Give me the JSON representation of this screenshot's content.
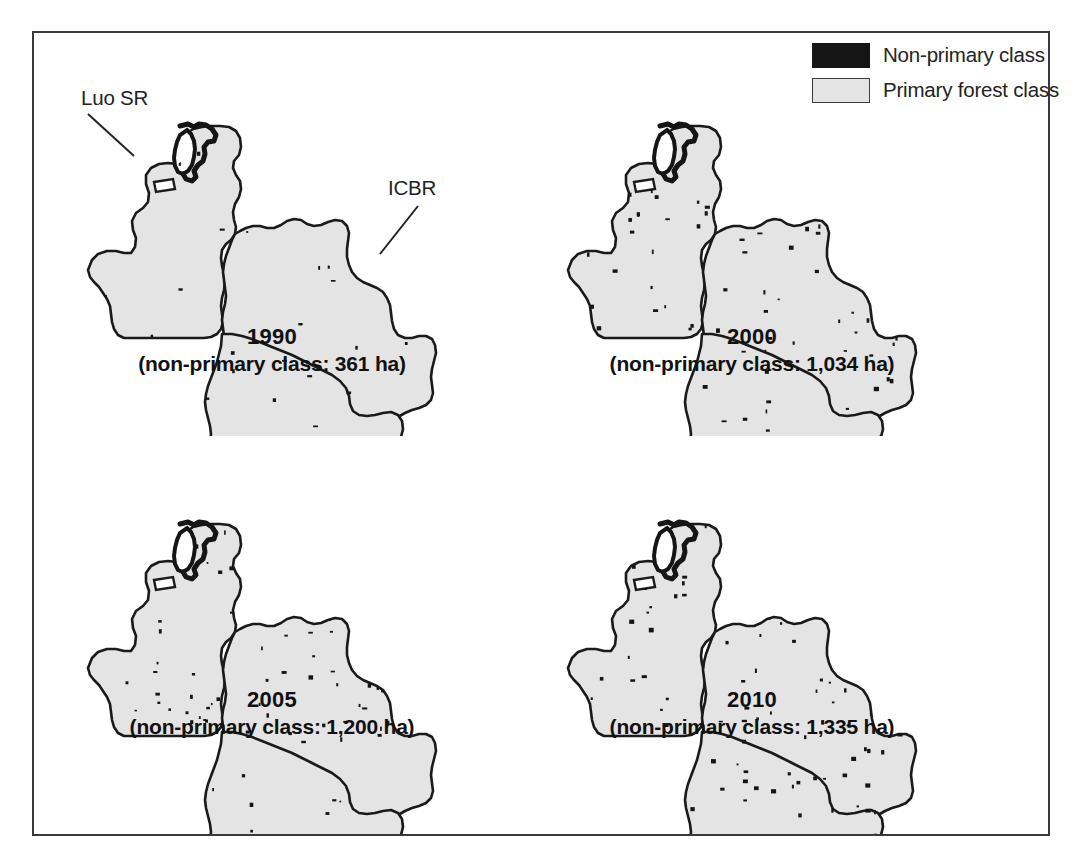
{
  "figure": {
    "background_color": "#ffffff",
    "frame_color": "#3a3a3a",
    "primary_fill_color": "#e4e4e4",
    "nonprimary_color": "#151515",
    "outline_color": "#1a1a1a"
  },
  "legend": {
    "items": [
      {
        "swatch": "nonprimary",
        "label": "Non-primary class",
        "color": "#151515"
      },
      {
        "swatch": "primary",
        "label": "Primary forest class",
        "color": "#e4e4e4"
      }
    ]
  },
  "annotations": [
    {
      "name": "luo-sr",
      "label": "Luo SR"
    },
    {
      "name": "icbr",
      "label": "ICBR"
    }
  ],
  "panels": [
    {
      "id": "1990",
      "year": "1990",
      "caption": "(non-primary class: 361 ha)",
      "nonprimary_ha": 361,
      "speckle_seed": 11,
      "speckle_count": 46
    },
    {
      "id": "2000",
      "year": "2000",
      "caption": "(non-primary class: 1,034 ha)",
      "nonprimary_ha": 1034,
      "speckle_seed": 29,
      "speckle_count": 132
    },
    {
      "id": "2005",
      "year": "2005",
      "caption": "(non-primary class: 1,200 ha)",
      "nonprimary_ha": 1200,
      "speckle_seed": 47,
      "speckle_count": 154
    },
    {
      "id": "2010",
      "year": "2010",
      "caption": "(non-primary class: 1,335 ha)",
      "nonprimary_ha": 1335,
      "speckle_seed": 73,
      "speckle_count": 172
    }
  ],
  "chart_data": {
    "type": "map",
    "title": "",
    "subtitle": "",
    "categories": [
      "1990",
      "2000",
      "2005",
      "2010"
    ],
    "values": [
      361,
      1034,
      1200,
      1335
    ],
    "ylabel": "Non-primary class (ha)",
    "xlabel": "Year",
    "series": [
      {
        "name": "Non-primary class (ha)",
        "values": [
          361,
          1034,
          1200,
          1335
        ]
      }
    ],
    "legend_entries": [
      "Non-primary class",
      "Primary forest class"
    ],
    "legend_position": "top-right",
    "regions": [
      "Luo SR",
      "ICBR"
    ],
    "grid": false
  },
  "geometry": {
    "outline": "M 96 117 L 100 108 L 109 105 L 118 107 L 126 108 L 133 104 L 140 100 L 146 97 L 152 97 L 156 93 L 158 84 L 157 75 L 160 68 L 166 64 L 170 59 L 170 52 L 172 46 L 179 44 L 190 44 L 203 43 L 214 43 L 221 45 L 223 50 L 224 57 L 227 60 L 233 58 L 240 55 L 247 53 L 252 50 L 256 49 L 259 53 L 258 60 L 256 66 L 257 72 L 261 75 L 266 73 L 270 69 L 275 71 L 279 77 L 281 85 L 282 94 L 281 103 L 283 110 L 289 112 L 296 110 L 303 106 L 311 103 L 318 100 L 324 99 L 330 101 L 337 101 L 344 99 L 351 96 L 358 95 L 365 97 L 372 99 L 379 99 L 385 97 L 391 95 L 398 95 L 403 99 L 405 106 L 404 114 L 403 122 L 403 131 L 405 140 L 409 147 L 415 152 L 422 156 L 429 159 L 436 163 L 441 168 L 444 175 L 446 183 L 447 192 L 449 200 L 453 206 L 459 209 L 466 209 L 473 207 L 480 206 L 486 208 L 490 213 L 492 220 L 491 228 L 489 235 L 488 243 L 489 251 L 491 258 L 490 266 L 486 272 L 480 276 L 473 278 L 466 280 L 459 283 L 453 287 L 448 292 L 444 298 L 441 305 L 439 313 L 437 321 L 434 328 L 430 334 L 425 339 L 419 343 L 413 347 L 408 352 L 404 358 L 401 365 L 398 372 L 394 378 L 389 382 L 383 384 L 376 384 L 369 382 L 363 379 L 357 375 L 352 370 L 348 364 L 345 357 L 343 350 L 342 342 L 343 334 L 345 327 L 348 321 L 352 316 L 357 312 L 362 308 L 366 303 L 368 297 L 368 290 L 366 283 L 362 277 L 357 272 L 351 268 L 344 265 L 337 263 L 330 262 L 323 262 L 316 263 L 309 265 L 302 268 L 296 272 L 291 277 L 287 283 L 284 290 L 281 297 L 277 303 L 272 307 L 266 310 L 259 311 L 252 311 L 245 310 L 238 308 L 231 306 L 224 304 L 217 303 L 210 303 L 203 304 L 196 306 L 189 308 L 182 309 L 175 309 L 168 307 L 162 304 L 157 300 L 153 295 L 150 289 L 148 282 L 147 275 L 146 268 L 145 261 L 143 254 L 140 248 L 136 243 L 131 239 L 125 236 L 118 234 L 111 233 L 104 233 L 97 233 L 90 232 L 84 229 L 79 225 L 76 219 L 75 212 L 76 205 L 78 198 L 81 191 L 85 185 L 89 179 L 92 172 L 94 165 L 95 158 L 96 151 Z"
  }
}
